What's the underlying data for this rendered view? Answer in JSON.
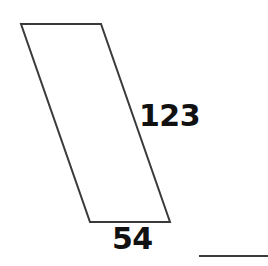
{
  "figure": {
    "type": "parallelogram-diagram",
    "background_color": "#ffffff",
    "stroke_color": "#3a3a3a",
    "fill_color": "none",
    "stroke_width": 2,
    "shape": {
      "name": "parallelogram",
      "vertices": [
        {
          "name": "top-left",
          "x": 21,
          "y": 24
        },
        {
          "name": "top-right",
          "x": 101,
          "y": 24
        },
        {
          "name": "bottom-right",
          "x": 170,
          "y": 222
        },
        {
          "name": "bottom-left",
          "x": 90,
          "y": 222
        }
      ],
      "points_attr": "21,24 101,24 170,222 90,222"
    },
    "labels": {
      "side_length": "123",
      "base_length": "54"
    },
    "rule": {
      "name": "baseline-rule",
      "x1": 199,
      "y1": 255,
      "x2": 268,
      "y2": 255,
      "color": "#3b3b3b"
    }
  }
}
